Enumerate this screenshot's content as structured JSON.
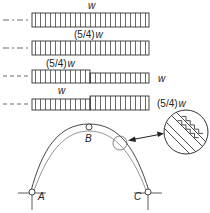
{
  "load_cases": [
    {
      "id": "case-1",
      "label_left": "w",
      "label_right": null,
      "description": "uniform load w over full span"
    },
    {
      "id": "case-2",
      "label_left": "(5/4)w",
      "label_right": null,
      "description": "uniform load (5/4)w over full span"
    },
    {
      "id": "case-3",
      "label_left": "(5/4)w",
      "label_right": "w",
      "description": "(5/4)w on left half, w on right half"
    },
    {
      "id": "case-4",
      "label_left": "w",
      "label_right": "(5/4)w",
      "description": "w on left half, (5/4)w on right half"
    }
  ],
  "arch": {
    "points": {
      "A": "A",
      "B": "B",
      "C": "C"
    },
    "detail": "magnified section of arch cross-section"
  },
  "labels": {
    "w": "w",
    "w54": "(5/4)",
    "w54_w": "w",
    "A": "A",
    "B": "B",
    "C": "C"
  }
}
